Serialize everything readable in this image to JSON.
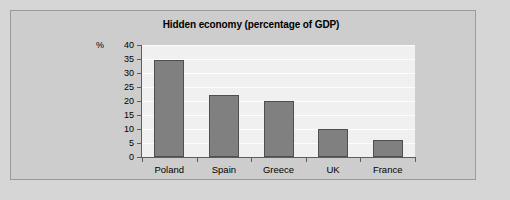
{
  "chart_data": {
    "type": "bar",
    "title": "Hidden economy (percentage of GDP)",
    "xlabel": "",
    "ylabel": "%",
    "unit_label": "%",
    "categories": [
      "Poland",
      "Spain",
      "Greece",
      "UK",
      "France"
    ],
    "values": [
      34.5,
      22,
      20,
      10,
      6
    ],
    "ylim": [
      0,
      40
    ],
    "ytick_step": 5,
    "yticks": [
      40,
      35,
      30,
      25,
      20,
      15,
      10,
      5,
      0
    ],
    "grid": true,
    "legend": null,
    "series_color": "#808080",
    "plot_background": "#eff0ef",
    "panel_background": "#cdcdcd",
    "page_background": "#d6d6d6"
  }
}
